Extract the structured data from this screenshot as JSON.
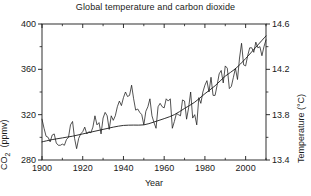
{
  "chart_data": {
    "type": "line",
    "title": "Global temperature and carbon dioxide",
    "xlabel": "Year",
    "ylabel": "CO2  (ppmv)",
    "ylabel_right": "Temperature (°C)",
    "xlim": [
      1900,
      2010
    ],
    "ylim": [
      280,
      400
    ],
    "ylim_right": [
      13.4,
      14.6
    ],
    "xticks": [
      1900,
      1920,
      1940,
      1960,
      1980,
      2000
    ],
    "xticklabels": [
      "1900",
      "1920",
      "1940",
      "1960",
      "1980",
      "2000"
    ],
    "xminorticks": [
      1910,
      1930,
      1950,
      1970,
      1990,
      2010
    ],
    "yticks": [
      280,
      320,
      360,
      400
    ],
    "yticklabels": [
      "280",
      "320",
      "360",
      "400"
    ],
    "yminorticks": [
      300,
      340,
      380
    ],
    "yticks_right": [
      13.4,
      13.8,
      14.2,
      14.6
    ],
    "yticklabels_right": [
      "13.4",
      "13.8",
      "14.2",
      "14.6"
    ],
    "yminorticks_right": [
      13.6,
      14.0,
      14.4
    ],
    "grid": false,
    "legend": "none",
    "line_color": "#1a1a1a",
    "axis_color": "#1a1a1a",
    "background": "#ffffff",
    "series": [
      {
        "name": "CO2 concentration",
        "axis": "left",
        "units": "ppmv",
        "smooth": true,
        "x": [
          1900,
          1905,
          1910,
          1915,
          1920,
          1925,
          1930,
          1935,
          1940,
          1945,
          1950,
          1955,
          1960,
          1965,
          1970,
          1975,
          1980,
          1985,
          1990,
          1995,
          2000,
          2005,
          2010
        ],
        "values": [
          296.0,
          298.0,
          299.5,
          301.0,
          303.0,
          305.0,
          307.0,
          309.0,
          310.5,
          310.8,
          311.0,
          313.5,
          316.5,
          320.0,
          325.5,
          331.0,
          338.5,
          345.5,
          354.0,
          360.5,
          369.5,
          379.5,
          389.5
        ]
      },
      {
        "name": "Global mean temperature (annual)",
        "axis": "right",
        "units": "°C",
        "smooth": false,
        "x": [
          1900,
          1901,
          1902,
          1903,
          1904,
          1905,
          1906,
          1907,
          1908,
          1909,
          1910,
          1911,
          1912,
          1913,
          1914,
          1915,
          1916,
          1917,
          1918,
          1919,
          1920,
          1921,
          1922,
          1923,
          1924,
          1925,
          1926,
          1927,
          1928,
          1929,
          1930,
          1931,
          1932,
          1933,
          1934,
          1935,
          1936,
          1937,
          1938,
          1939,
          1940,
          1941,
          1942,
          1943,
          1944,
          1945,
          1946,
          1947,
          1948,
          1949,
          1950,
          1951,
          1952,
          1953,
          1954,
          1955,
          1956,
          1957,
          1958,
          1959,
          1960,
          1961,
          1962,
          1963,
          1964,
          1965,
          1966,
          1967,
          1968,
          1969,
          1970,
          1971,
          1972,
          1973,
          1974,
          1975,
          1976,
          1977,
          1978,
          1979,
          1980,
          1981,
          1982,
          1983,
          1984,
          1985,
          1986,
          1987,
          1988,
          1989,
          1990,
          1991,
          1992,
          1993,
          1994,
          1995,
          1996,
          1997,
          1998,
          1999,
          2000,
          2001,
          2002,
          2003,
          2004,
          2005,
          2006,
          2007,
          2008,
          2009,
          2010
        ],
        "values": [
          13.76,
          13.68,
          13.61,
          13.6,
          13.56,
          13.62,
          13.63,
          13.55,
          13.53,
          13.53,
          13.54,
          13.53,
          13.58,
          13.6,
          13.71,
          13.74,
          13.59,
          13.5,
          13.59,
          13.63,
          13.65,
          13.69,
          13.63,
          13.65,
          13.64,
          13.69,
          13.79,
          13.71,
          13.73,
          13.63,
          13.77,
          13.82,
          13.79,
          13.67,
          13.79,
          13.75,
          13.79,
          13.87,
          13.92,
          13.88,
          13.95,
          14.0,
          13.96,
          13.97,
          14.06,
          13.94,
          13.84,
          13.85,
          13.82,
          13.8,
          13.71,
          13.83,
          13.87,
          13.94,
          13.79,
          13.73,
          13.68,
          13.87,
          13.9,
          13.87,
          13.86,
          13.94,
          13.92,
          13.94,
          13.68,
          13.74,
          13.81,
          13.8,
          13.79,
          13.93,
          13.92,
          13.76,
          13.86,
          14.0,
          13.77,
          13.8,
          13.71,
          13.95,
          13.9,
          14.0,
          14.06,
          14.1,
          14.0,
          14.13,
          13.97,
          13.97,
          14.06,
          14.16,
          14.19,
          14.08,
          14.23,
          14.21,
          14.03,
          14.05,
          14.13,
          14.21,
          14.11,
          14.3,
          14.43,
          14.24,
          14.23,
          14.32,
          14.39,
          14.39,
          14.35,
          14.44,
          14.39,
          14.4,
          14.32,
          14.4,
          14.46
        ]
      }
    ]
  }
}
